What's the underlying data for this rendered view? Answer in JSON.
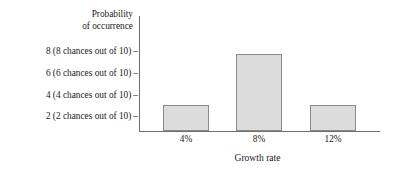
{
  "chart_data": {
    "type": "bar",
    "title": "",
    "subtitle": "",
    "xlabel": "Growth rate",
    "ylabel": "Probability of occurrence",
    "ylabel_lines": [
      "Probability",
      "of occurrence"
    ],
    "categories": [
      "4%",
      "8%",
      "12%"
    ],
    "values": [
      2,
      6,
      2
    ],
    "ylim": [
      0,
      9
    ],
    "yticks": [
      2,
      4,
      6,
      8
    ],
    "ytick_labels": [
      "8 (8 chances out of 10)",
      "6 (6 chances out of 10)",
      "4 (4 chances out of 10)",
      "2 (2 chances out of 10)"
    ],
    "ytick_dash": "–",
    "grid": false,
    "legend": "none",
    "bar_fill_color": "#dcdcdc",
    "bar_border_color": "#8a8a8a",
    "axis_color": "#6e6e6e",
    "background_color": "#ffffff"
  },
  "axes": {
    "y_title_line1": "Probability",
    "y_title_line2": "of occurrence",
    "x_title": "Growth rate"
  },
  "y_ticks": [
    {
      "label": "8 (8 chances out of 10)",
      "dash": "–",
      "value": 8
    },
    {
      "label": "6 (6 chances out of 10)",
      "dash": "–",
      "value": 6
    },
    {
      "label": "4 (4 chances out of 10)",
      "dash": "–",
      "value": 4
    },
    {
      "label": "2 (2 chances out of 10)",
      "dash": "–",
      "value": 2
    }
  ],
  "x_ticks": [
    {
      "label": "4%",
      "value": 2
    },
    {
      "label": "8%",
      "value": 6
    },
    {
      "label": "12%",
      "value": 2
    }
  ]
}
